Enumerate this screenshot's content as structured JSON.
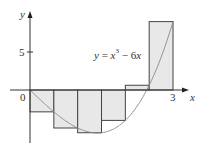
{
  "figure": {
    "equation": {
      "lhs": "y",
      "eq": " = ",
      "x": "x",
      "exp": "3",
      "rest": " − 6",
      "x2": "x"
    },
    "axis_labels": {
      "x": "x",
      "y": "y"
    },
    "tick_labels": {
      "origin": "0",
      "y5": "5",
      "x3": "3"
    },
    "colors": {
      "fill": "#e8e8e8",
      "stroke": "#444444",
      "curve": "#888888",
      "axis": "#333333"
    }
  },
  "chart_data": {
    "type": "riemann-sum",
    "function": "x^3 - 6x",
    "method": "right endpoints",
    "interval": [
      0,
      3
    ],
    "n": 6,
    "dx": 0.5,
    "rectangles": [
      {
        "x_left": 0.0,
        "x_right": 0.5,
        "height": -2.875
      },
      {
        "x_left": 0.5,
        "x_right": 1.0,
        "height": -5.0
      },
      {
        "x_left": 1.0,
        "x_right": 1.5,
        "height": -5.625
      },
      {
        "x_left": 1.5,
        "x_right": 2.0,
        "height": -4.0
      },
      {
        "x_left": 2.0,
        "x_right": 2.5,
        "height": 0.625
      },
      {
        "x_left": 2.5,
        "x_right": 3.0,
        "height": 9.0
      }
    ],
    "xlabel": "x",
    "ylabel": "y",
    "x_ticks": [
      0,
      3
    ],
    "y_ticks": [
      0,
      5
    ],
    "grid": false
  }
}
